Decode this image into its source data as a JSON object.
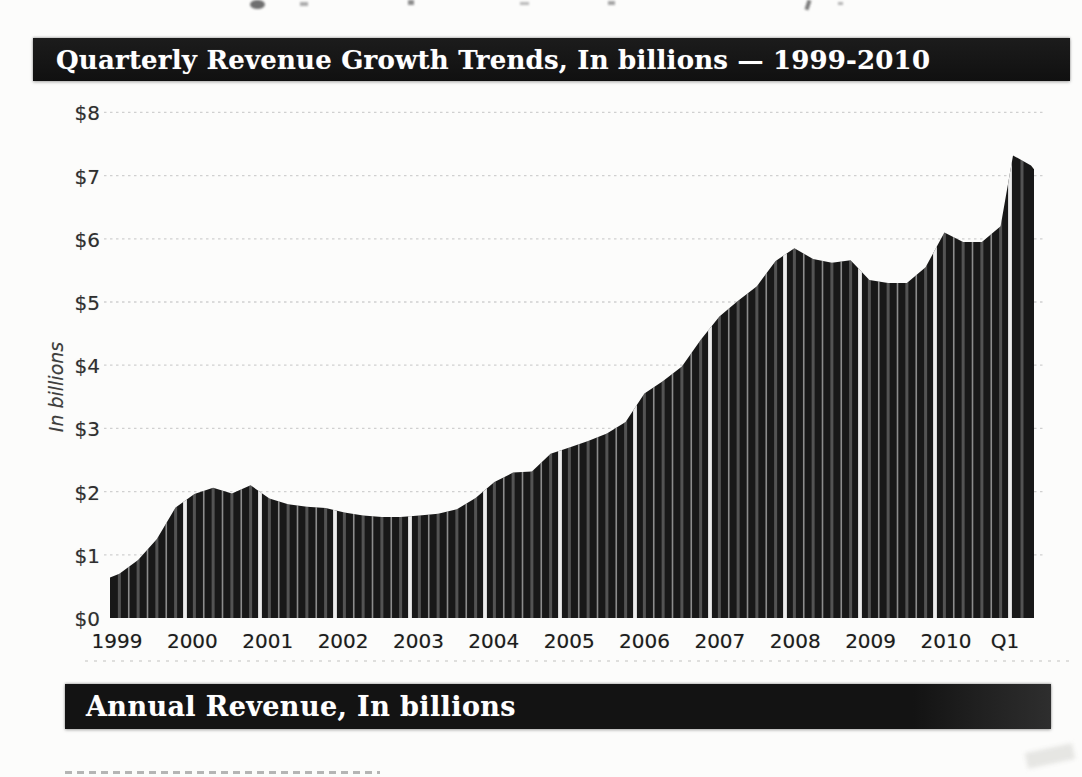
{
  "page": {
    "background_color": "#fcfcfb"
  },
  "quarterly_header": {
    "title": "Quarterly Revenue Growth Trends, In billions — 1999-2010",
    "bg_color": "#111111",
    "text_color": "#ffffff"
  },
  "annual_header": {
    "title": "Annual Revenue, In billions",
    "bg_color": "#111111",
    "text_color": "#ffffff"
  },
  "chart_data": {
    "type": "bar",
    "title": "Quarterly Revenue Growth Trends, In billions — 1999-2010",
    "xlabel": "",
    "ylabel": "In billions",
    "unit": "USD billions",
    "ylim": [
      0,
      8
    ],
    "y_tick_labels": [
      "$0",
      "$1",
      "$2",
      "$3",
      "$4",
      "$5",
      "$6",
      "$7",
      "$8"
    ],
    "x_tick_labels": [
      "1999",
      "2000",
      "2001",
      "2002",
      "2003",
      "2004",
      "2005",
      "2006",
      "2007",
      "2008",
      "2009",
      "2010",
      "Q1"
    ],
    "grid": "faint dotted horizontal gridlines at each $1 increment",
    "legend": "none",
    "bar_color": "#181818",
    "separator_style": "thin light gap between quarters, wide white gap between years, gray highlight stripe inside each bar",
    "groups": [
      {
        "label": "1999",
        "values": [
          0.7,
          0.92,
          1.25,
          1.75
        ]
      },
      {
        "label": "2000",
        "values": [
          1.96,
          2.06,
          1.97,
          2.1
        ]
      },
      {
        "label": "2001",
        "values": [
          1.89,
          1.8,
          1.76,
          1.74
        ]
      },
      {
        "label": "2002",
        "values": [
          1.67,
          1.62,
          1.6,
          1.6
        ]
      },
      {
        "label": "2003",
        "values": [
          1.62,
          1.65,
          1.72,
          1.9
        ]
      },
      {
        "label": "2004",
        "values": [
          2.15,
          2.3,
          2.32,
          2.6
        ]
      },
      {
        "label": "2005",
        "values": [
          2.7,
          2.8,
          2.92,
          3.1
        ]
      },
      {
        "label": "2006",
        "values": [
          3.55,
          3.75,
          3.98,
          4.4
        ]
      },
      {
        "label": "2007",
        "values": [
          4.77,
          5.02,
          5.25,
          5.65
        ]
      },
      {
        "label": "2008",
        "values": [
          5.85,
          5.68,
          5.62,
          5.66
        ]
      },
      {
        "label": "2009",
        "values": [
          5.35,
          5.3,
          5.3,
          5.55
        ]
      },
      {
        "label": "2010",
        "values": [
          6.1,
          5.95,
          5.95,
          6.2
        ]
      },
      {
        "label": "Q1",
        "values": [
          7.3
        ]
      }
    ]
  }
}
